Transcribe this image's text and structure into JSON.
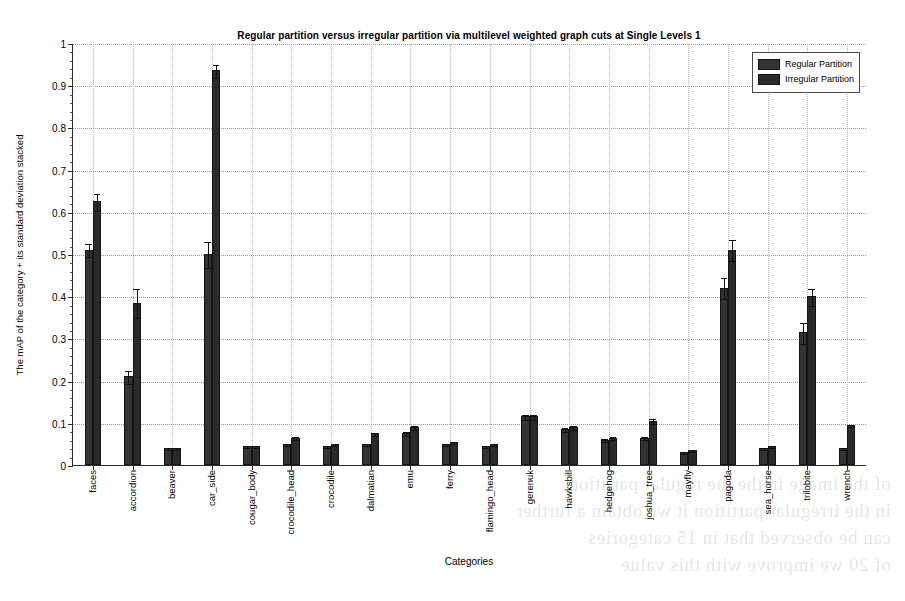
{
  "chart_data": {
    "type": "bar",
    "title": "Regular partition versus irregular partition via multilevel weighted graph cuts at Single Levels 1",
    "xlabel": "Categories",
    "ylabel": "The mAP of the category + its standard deviation stacked",
    "ylim": [
      0,
      1
    ],
    "ytick_values": [
      0,
      0.1,
      0.2,
      0.3,
      0.4,
      0.5,
      0.6,
      0.7,
      0.8,
      0.9,
      1
    ],
    "ytick_labels": [
      "0",
      "0.1",
      "0.2",
      "0.3",
      "0.4",
      "0.5",
      "0.6",
      "0.7",
      "0.8",
      "0.9",
      "1"
    ],
    "grid": true,
    "legend_position": "top-right",
    "categories": [
      "faces",
      "accordion",
      "beaver",
      "car_side",
      "cougar_body",
      "crocodile_head",
      "crocodile",
      "dalmatian",
      "emu",
      "ferry",
      "flamingo_head",
      "gerenuk",
      "hawksbill",
      "hedgehog",
      "joshua_tree",
      "mayfly",
      "pagoda",
      "sea_horse",
      "trilobite",
      "wrench"
    ],
    "series": [
      {
        "name": "Regular Partition",
        "color": "#333333",
        "values": [
          0.51,
          0.21,
          0.04,
          0.5,
          0.045,
          0.05,
          0.045,
          0.05,
          0.075,
          0.05,
          0.045,
          0.115,
          0.085,
          0.06,
          0.065,
          0.03,
          0.42,
          0.04,
          0.315,
          0.04
        ],
        "errors": [
          0.015,
          0.015,
          0.002,
          0.03,
          0.002,
          0.003,
          0.002,
          0.003,
          0.005,
          0.003,
          0.002,
          0.005,
          0.004,
          0.003,
          0.004,
          0.002,
          0.025,
          0.002,
          0.025,
          0.002
        ]
      },
      {
        "name": "Irregular Partition",
        "color": "#2a2a2a",
        "values": [
          0.625,
          0.385,
          0.04,
          0.935,
          0.045,
          0.065,
          0.05,
          0.075,
          0.09,
          0.055,
          0.05,
          0.115,
          0.09,
          0.065,
          0.105,
          0.035,
          0.51,
          0.045,
          0.4,
          0.095
        ],
        "errors": [
          0.02,
          0.035,
          0.002,
          0.015,
          0.002,
          0.004,
          0.003,
          0.004,
          0.005,
          0.003,
          0.002,
          0.005,
          0.004,
          0.003,
          0.006,
          0.002,
          0.025,
          0.002,
          0.02,
          0.003
        ]
      }
    ]
  },
  "legend": {
    "items": [
      {
        "label": "Regular Partition",
        "color": "#333333"
      },
      {
        "label": "Irregular Partition",
        "color": "#2a2a2a"
      }
    ]
  },
  "artifact": {
    "bleed_lines": [
      "of the image in the the regular partition",
      "in the irregular partition it we obtain a further",
      "can be observed that in 15 categories",
      "of 20 we improve with this value"
    ]
  }
}
